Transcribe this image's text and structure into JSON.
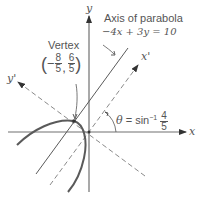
{
  "diagram": {
    "type": "rotated-parabola",
    "axes": {
      "x_label": "x",
      "y_label": "y",
      "x_prime_label": "x'",
      "y_prime_label": "y'"
    },
    "vertex": {
      "title": "Vertex",
      "x_sign": "−",
      "x_num": "8",
      "x_den": "5",
      "y_num": "6",
      "y_den": "5",
      "sep": ","
    },
    "axis_of_parabola": {
      "title": "Axis of parabola",
      "equation": "−4x + 3y = 10"
    },
    "angle": {
      "symbol": "θ",
      "eq": "= sin",
      "sup": "−1",
      "num": "4",
      "den": "5"
    },
    "colors": {
      "axes": "#707070",
      "curve": "#5a5a5a",
      "dashed": "#8a8a8a",
      "text": "#555555"
    }
  }
}
